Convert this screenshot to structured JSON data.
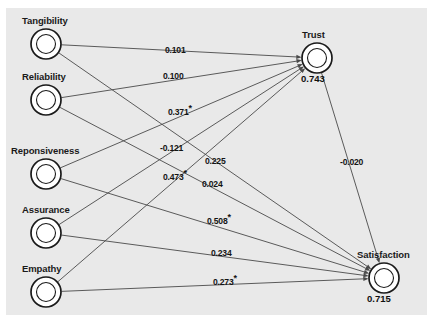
{
  "figure": {
    "type": "path-diagram",
    "background": "#e9e9e9",
    "page_background": "#ffffff",
    "line_color": "#4a4a4a",
    "node_stroke": "#1a1a1a",
    "node_fill": "#ffffff",
    "width": 433,
    "height": 323
  },
  "nodes": [
    {
      "id": "tangibility",
      "label": "Tangibility",
      "value": "",
      "cx": 46,
      "cy": 44,
      "r_outer": 15,
      "r_inner": 9.5,
      "label_x": 22,
      "label_y": 15,
      "kind": "exogenous"
    },
    {
      "id": "reliability",
      "label": "Reliability",
      "value": "",
      "cx": 46,
      "cy": 100,
      "r_outer": 15,
      "r_inner": 9.5,
      "label_x": 22,
      "label_y": 71,
      "kind": "exogenous"
    },
    {
      "id": "reponsiveness",
      "label": "Reponsiveness",
      "value": "",
      "cx": 46,
      "cy": 174,
      "r_outer": 15,
      "r_inner": 9.5,
      "label_x": 11,
      "label_y": 145,
      "kind": "exogenous"
    },
    {
      "id": "assurance",
      "label": "Assurance",
      "value": "",
      "cx": 46,
      "cy": 233,
      "r_outer": 15,
      "r_inner": 9.5,
      "label_x": 22,
      "label_y": 204,
      "kind": "exogenous"
    },
    {
      "id": "empathy",
      "label": "Empathy",
      "value": "",
      "cx": 46,
      "cy": 292,
      "r_outer": 15,
      "r_inner": 9.5,
      "label_x": 22,
      "label_y": 263,
      "kind": "exogenous"
    },
    {
      "id": "trust",
      "label": "Trust",
      "value": "0.743",
      "cx": 317,
      "cy": 58,
      "r_outer": 15,
      "r_inner": 9.5,
      "label_x": 302,
      "label_y": 29,
      "val_x": 301,
      "val_y": 73,
      "kind": "endogenous"
    },
    {
      "id": "satisfaction",
      "label": "Satisfaction",
      "value": "0.715",
      "cx": 384,
      "cy": 278,
      "r_outer": 15,
      "r_inner": 9.5,
      "label_x": 357,
      "label_y": 249,
      "val_x": 367,
      "val_y": 293,
      "kind": "endogenous"
    }
  ],
  "edges": [
    {
      "id": "tangibility-trust",
      "from": "tangibility",
      "to": "trust",
      "coefficient": "0.101",
      "significant": false,
      "label_x": 165,
      "label_y": 45
    },
    {
      "id": "reliability-trust",
      "from": "reliability",
      "to": "trust",
      "coefficient": "0.100",
      "significant": false,
      "label_x": 163,
      "label_y": 71
    },
    {
      "id": "reponsiveness-trust",
      "from": "reponsiveness",
      "to": "trust",
      "coefficient": "0.371",
      "significant": true,
      "label_x": 168,
      "label_y": 107
    },
    {
      "id": "assurance-trust",
      "from": "assurance",
      "to": "trust",
      "coefficient": "-0.121",
      "significant": false,
      "label_x": 160,
      "label_y": 143
    },
    {
      "id": "tangibility-satisfaction",
      "from": "tangibility",
      "to": "satisfaction",
      "coefficient": "0.225",
      "significant": false,
      "label_x": 205,
      "label_y": 156
    },
    {
      "id": "empathy-trust",
      "from": "empathy",
      "to": "trust",
      "coefficient": "0.473",
      "significant": true,
      "label_x": 163,
      "label_y": 172
    },
    {
      "id": "reliability-satisfaction",
      "from": "reliability",
      "to": "satisfaction",
      "coefficient": "0.024",
      "significant": false,
      "label_x": 202,
      "label_y": 179
    },
    {
      "id": "reponsiveness-satisfaction",
      "from": "reponsiveness",
      "to": "satisfaction",
      "coefficient": "0.508",
      "significant": true,
      "label_x": 207,
      "label_y": 216
    },
    {
      "id": "assurance-satisfaction",
      "from": "assurance",
      "to": "satisfaction",
      "coefficient": "0.234",
      "significant": false,
      "label_x": 211,
      "label_y": 248
    },
    {
      "id": "empathy-satisfaction",
      "from": "empathy",
      "to": "satisfaction",
      "coefficient": "0.273",
      "significant": true,
      "label_x": 213,
      "label_y": 277
    },
    {
      "id": "trust-satisfaction",
      "from": "trust",
      "to": "satisfaction",
      "coefficient": "-0.020",
      "significant": false,
      "label_x": 340,
      "label_y": 157
    }
  ],
  "chart_data": {
    "type": "diagram",
    "title": "",
    "notation": "*",
    "paths": [
      {
        "predictor": "Tangibility",
        "outcome": "Trust",
        "beta": 0.101,
        "significant": false
      },
      {
        "predictor": "Reliability",
        "outcome": "Trust",
        "beta": 0.1,
        "significant": false
      },
      {
        "predictor": "Reponsiveness",
        "outcome": "Trust",
        "beta": 0.371,
        "significant": true
      },
      {
        "predictor": "Assurance",
        "outcome": "Trust",
        "beta": -0.121,
        "significant": false
      },
      {
        "predictor": "Empathy",
        "outcome": "Trust",
        "beta": 0.473,
        "significant": true
      },
      {
        "predictor": "Tangibility",
        "outcome": "Satisfaction",
        "beta": 0.225,
        "significant": false
      },
      {
        "predictor": "Reliability",
        "outcome": "Satisfaction",
        "beta": 0.024,
        "significant": false
      },
      {
        "predictor": "Reponsiveness",
        "outcome": "Satisfaction",
        "beta": 0.508,
        "significant": true
      },
      {
        "predictor": "Assurance",
        "outcome": "Satisfaction",
        "beta": 0.234,
        "significant": false
      },
      {
        "predictor": "Empathy",
        "outcome": "Satisfaction",
        "beta": 0.273,
        "significant": true
      },
      {
        "predictor": "Trust",
        "outcome": "Satisfaction",
        "beta": -0.02,
        "significant": false
      }
    ],
    "r_squared": [
      {
        "construct": "Trust",
        "value": 0.743
      },
      {
        "construct": "Satisfaction",
        "value": 0.715
      }
    ]
  }
}
